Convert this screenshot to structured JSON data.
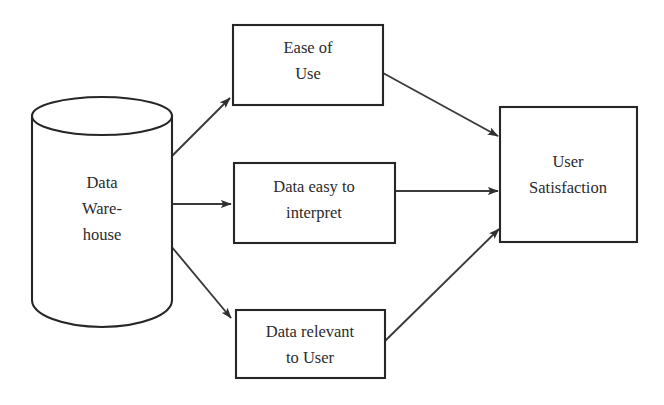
{
  "diagram": {
    "type": "flow-diagram",
    "background_color": "#ffffff",
    "stroke_color": "#262626",
    "text_color": "#2b2b2b",
    "nodes": [
      {
        "id": "data-warehouse",
        "shape": "cylinder",
        "lines": [
          "Data",
          "Ware-",
          "house"
        ],
        "text": "Data Ware-house"
      },
      {
        "id": "ease-of-use",
        "shape": "rectangle",
        "lines": [
          "Ease of",
          "Use"
        ],
        "text": "Ease of Use"
      },
      {
        "id": "data-easy-to-interpret",
        "shape": "rectangle",
        "lines": [
          "Data easy to",
          "interpret"
        ],
        "text": "Data easy to interpret"
      },
      {
        "id": "data-relevant-to-user",
        "shape": "rectangle",
        "lines": [
          "Data relevant",
          "to User"
        ],
        "text": "Data relevant to User"
      },
      {
        "id": "user-satisfaction",
        "shape": "rectangle",
        "lines": [
          "User",
          "Satisfaction"
        ],
        "text": "User Satisfaction"
      }
    ],
    "edges": [
      {
        "from": "data-warehouse",
        "to": "ease-of-use",
        "style": "solid-arrow"
      },
      {
        "from": "data-warehouse",
        "to": "data-easy-to-interpret",
        "style": "solid-arrow"
      },
      {
        "from": "data-warehouse",
        "to": "data-relevant-to-user",
        "style": "solid-arrow"
      },
      {
        "from": "ease-of-use",
        "to": "user-satisfaction",
        "style": "solid-arrow"
      },
      {
        "from": "data-easy-to-interpret",
        "to": "user-satisfaction",
        "style": "solid-arrow"
      },
      {
        "from": "data-relevant-to-user",
        "to": "user-satisfaction",
        "style": "solid-arrow"
      }
    ],
    "caption_fragment": ""
  }
}
